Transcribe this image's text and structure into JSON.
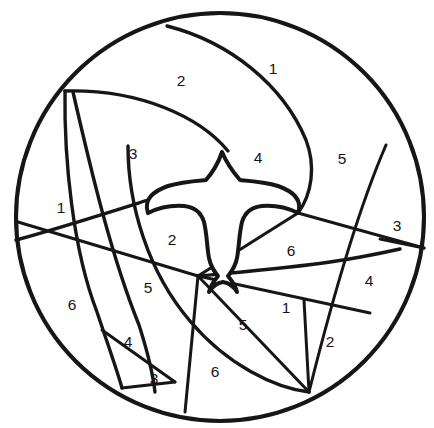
{
  "page": {
    "background_color": "#ffffff",
    "line_color": "#161616",
    "text_color": "#141414"
  },
  "figure": {
    "type": "color-by-number-coloring-page",
    "circle": {
      "center_x": 220,
      "center_y": 217,
      "radius": 204
    }
  },
  "regions": [
    {
      "id": "r-top-2",
      "label": "2",
      "x": 181,
      "y": 80
    },
    {
      "id": "r-top-1",
      "label": "1",
      "x": 273,
      "y": 68
    },
    {
      "id": "r-left-3",
      "label": "3",
      "x": 133,
      "y": 153
    },
    {
      "id": "r-center-4",
      "label": "4",
      "x": 258,
      "y": 157
    },
    {
      "id": "r-right-5",
      "label": "5",
      "x": 342,
      "y": 158
    },
    {
      "id": "r-left-1",
      "label": "1",
      "x": 61,
      "y": 207
    },
    {
      "id": "r-far-right-3",
      "label": "3",
      "x": 397,
      "y": 225
    },
    {
      "id": "r-inner-2",
      "label": "2",
      "x": 172,
      "y": 239
    },
    {
      "id": "r-inner-6",
      "label": "6",
      "x": 291,
      "y": 250
    },
    {
      "id": "r-right-4",
      "label": "4",
      "x": 369,
      "y": 280
    },
    {
      "id": "r-inner-5",
      "label": "5",
      "x": 148,
      "y": 287
    },
    {
      "id": "r-lower-1",
      "label": "1",
      "x": 286,
      "y": 307
    },
    {
      "id": "r-left-6",
      "label": "6",
      "x": 72,
      "y": 304
    },
    {
      "id": "r-bottom-5",
      "label": "5",
      "x": 243,
      "y": 324
    },
    {
      "id": "r-bottom-2",
      "label": "2",
      "x": 330,
      "y": 341
    },
    {
      "id": "r-lower-4",
      "label": "4",
      "x": 128,
      "y": 341
    },
    {
      "id": "r-bottom-3",
      "label": "3",
      "x": 154,
      "y": 378
    },
    {
      "id": "r-bottom-6",
      "label": "6",
      "x": 215,
      "y": 371
    }
  ],
  "palette_numbers": [
    "1",
    "2",
    "3",
    "4",
    "5",
    "6"
  ]
}
